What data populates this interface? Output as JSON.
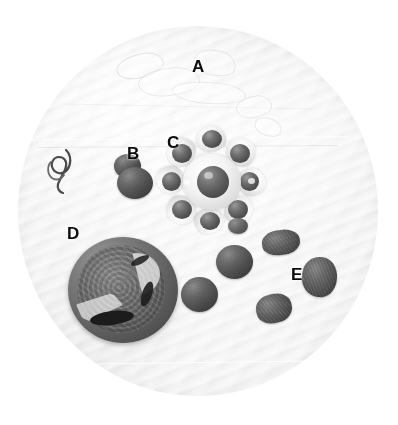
{
  "figure": {
    "kind": "specimen-photograph",
    "background": {
      "shape": "circle",
      "surface": "ribbed white filter paper / dish",
      "base_color": "#f3f3f3",
      "edge_color": "#e3e3e3",
      "page_color": "#ffffff"
    },
    "palette": {
      "label_color": "#0b0b0b",
      "seed_dark": "#3f3f3f",
      "seed_mid": "#6d6d6d",
      "seed_light": "#8e8e8e",
      "capsule_white": "#ffffff",
      "capsule_shadow": "#c0c0c0",
      "fruit_rind": "#4c4c4c",
      "fruit_flesh": "#5d5d5d"
    },
    "labels": [
      {
        "id": "A",
        "text": "A",
        "x": 192,
        "y": 58,
        "refers_to": "translucent membrane fragments"
      },
      {
        "id": "B",
        "text": "B",
        "x": 127,
        "y": 145,
        "refers_to": "isolated dark seed"
      },
      {
        "id": "C",
        "text": "C",
        "x": 167,
        "y": 134,
        "refers_to": "star-shaped capsule with seeds in chambers"
      },
      {
        "id": "D",
        "text": "D",
        "x": 67,
        "y": 225,
        "refers_to": "sectioned fruit showing interior"
      },
      {
        "id": "E",
        "text": "E",
        "x": 291,
        "y": 266,
        "refers_to": "group of loose seeds"
      }
    ],
    "specimens": [
      {
        "id": "tendril",
        "name": "coiled tendril / wire",
        "x": 42,
        "y": 148,
        "w": 44,
        "h": 48
      },
      {
        "id": "seed-b",
        "name": "seed B",
        "x": 117,
        "y": 160,
        "w": 37,
        "h": 37
      },
      {
        "id": "capsule-c",
        "name": "capsule C",
        "x": 156,
        "y": 128,
        "w": 112,
        "h": 110
      },
      {
        "id": "fruit-d",
        "name": "sectioned fruit D",
        "x": 68,
        "y": 237,
        "w": 110,
        "h": 106
      },
      {
        "id": "seed-e1",
        "name": "seed",
        "x": 262,
        "y": 230,
        "w": 36,
        "h": 24
      },
      {
        "id": "seed-e2",
        "name": "seed",
        "x": 302,
        "y": 258,
        "w": 34,
        "h": 38
      },
      {
        "id": "seed-e3",
        "name": "seed",
        "x": 256,
        "y": 295,
        "w": 34,
        "h": 28
      },
      {
        "id": "seed-e4",
        "name": "seed",
        "x": 217,
        "y": 246,
        "w": 36,
        "h": 33
      },
      {
        "id": "seed-e5",
        "name": "seed",
        "x": 182,
        "y": 278,
        "w": 36,
        "h": 34
      }
    ]
  }
}
